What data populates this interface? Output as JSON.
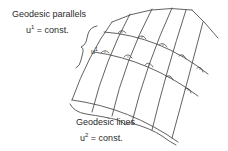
{
  "diagram": {
    "parallels_label": {
      "title": "Geodesic parallels",
      "var": "u",
      "sup": "1",
      "rest": " = const."
    },
    "lines_label": {
      "title": "Geodesic lines",
      "var": "u",
      "sup": "2",
      "rest": " = const."
    },
    "grid_marker": {
      "var": "u",
      "sup": "1"
    },
    "colors": {
      "stroke": "#3a3a3a",
      "text": "#2a2a2a",
      "background": "#ffffff"
    },
    "right_angle_marks": 10
  }
}
